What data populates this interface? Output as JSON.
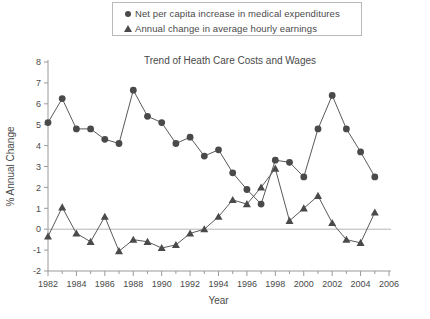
{
  "legend": {
    "position": "top-center",
    "entries": [
      {
        "marker": "circle-marker-icon",
        "label": "Net per capita increase in medical expenditures"
      },
      {
        "marker": "triangle-marker-icon",
        "label": "Annual change in average hourly earnings"
      }
    ]
  },
  "chart_data": {
    "type": "line",
    "title": "Trend of Heath Care Costs and Wages",
    "xlabel": "Year",
    "ylabel": "% Annual Change",
    "xlim": [
      1982,
      2006
    ],
    "ylim": [
      -2,
      8
    ],
    "ytick_step": 1,
    "xtick_step": 2,
    "x_minor_tick_step": 1,
    "grid": false,
    "zero_line": true,
    "legend_position": "top-center",
    "x": [
      1982,
      1983,
      1984,
      1985,
      1986,
      1987,
      1988,
      1989,
      1990,
      1991,
      1992,
      1993,
      1994,
      1995,
      1996,
      1997,
      1998,
      1999,
      2000,
      2001,
      2002,
      2003,
      2004,
      2005
    ],
    "xticklabels": [
      "1982",
      "1984",
      "1986",
      "1988",
      "1990",
      "1992",
      "1994",
      "1996",
      "1998",
      "2000",
      "2002",
      "2004",
      "2006"
    ],
    "yticklabels": [
      "8",
      "7",
      "6",
      "5",
      "4",
      "3",
      "2",
      "1",
      "0",
      "-1",
      "-2"
    ],
    "series": [
      {
        "name": "Net per capita increase in medical expenditures",
        "marker": "circle",
        "color": "#4a4a4a",
        "values": [
          5.1,
          6.25,
          4.8,
          4.8,
          4.3,
          4.1,
          6.65,
          5.4,
          5.1,
          4.1,
          4.4,
          3.5,
          3.8,
          2.7,
          1.9,
          1.2,
          3.3,
          3.2,
          2.5,
          4.8,
          6.4,
          4.8,
          3.7,
          2.5
        ]
      },
      {
        "name": "Annual change in average hourly earnings",
        "marker": "triangle",
        "color": "#4a4a4a",
        "values": [
          -0.35,
          1.05,
          -0.2,
          -0.6,
          0.6,
          -1.05,
          -0.5,
          -0.6,
          -0.9,
          -0.75,
          -0.2,
          0.0,
          0.6,
          1.4,
          1.2,
          2.0,
          2.9,
          0.4,
          1.0,
          1.6,
          0.3,
          -0.5,
          -0.65,
          0.8
        ]
      }
    ]
  }
}
